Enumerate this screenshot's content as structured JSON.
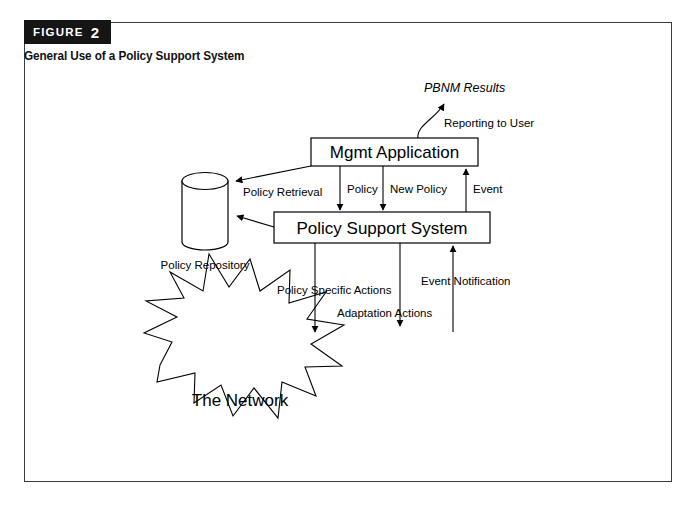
{
  "figure": {
    "tag_word": "FIGURE",
    "tag_number": "2",
    "subtitle": "General Use of a Policy Support System"
  },
  "nodes": {
    "mgmt_application": "Mgmt Application",
    "policy_support_system": "Policy Support System",
    "policy_repository": "Policy Repository",
    "network": "The Network",
    "pbnm_results": "PBNM Results"
  },
  "edges": {
    "reporting_to_user": "Reporting to User",
    "policy_retrieval": "Policy Retrieval",
    "policy": "Policy",
    "new_policy": "New Policy",
    "event": "Event",
    "policy_specific_actions": "Policy Specific Actions",
    "adaptation_actions": "Adaptation Actions",
    "event_notification": "Event Notification"
  },
  "colors": {
    "tag_background": "#151515",
    "tag_text": "#ffffff",
    "frame_border": "#3c3c3c",
    "stroke": "#000000",
    "canvas": "#ffffff"
  }
}
